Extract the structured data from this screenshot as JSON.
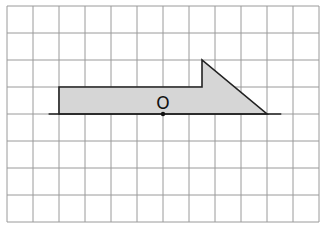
{
  "diagram": {
    "type": "grid-figure",
    "grid": {
      "columns": 12,
      "rows": 8,
      "origin_px": [
        7,
        6
      ],
      "cell_width_px": 26,
      "cell_height_px": 27,
      "line_color": "#9a9a9a"
    },
    "shape": {
      "description": "Shaded polygon: rectangle with a right-triangle arrowhead on the right end, resting on a horizontal line",
      "fill_color": "#d6d6d6",
      "stroke_color": "#222222",
      "vertices_grid": [
        [
          2,
          4
        ],
        [
          2,
          3
        ],
        [
          7.5,
          3
        ],
        [
          7.5,
          2
        ],
        [
          10,
          4
        ]
      ]
    },
    "baseline": {
      "from_grid": [
        1.6,
        4
      ],
      "to_grid": [
        10.55,
        4
      ]
    },
    "point": {
      "label": "O",
      "position_grid": [
        6,
        4
      ]
    }
  }
}
